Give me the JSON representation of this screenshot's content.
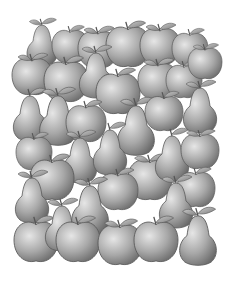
{
  "scene": {
    "description": "Grayscale illustration of densely packed apples and pears with leaves and stems",
    "background": "#ffffff",
    "palette": {
      "light": "#d9d9d9",
      "mid": "#a6a6a6",
      "dark": "#6e6e6e",
      "outline": "#5a5a5a",
      "leaf": "#9a9a9a"
    },
    "fruits": [
      {
        "type": "pear",
        "x": 42,
        "y": 45,
        "s": 0.9
      },
      {
        "type": "apple",
        "x": 70,
        "y": 45,
        "s": 0.9
      },
      {
        "type": "apple",
        "x": 98,
        "y": 48,
        "s": 1.0
      },
      {
        "type": "apple",
        "x": 128,
        "y": 45,
        "s": 1.1
      },
      {
        "type": "apple",
        "x": 160,
        "y": 45,
        "s": 1.0
      },
      {
        "type": "apple",
        "x": 190,
        "y": 48,
        "s": 0.9
      },
      {
        "type": "apple",
        "x": 32,
        "y": 75,
        "s": 1.0
      },
      {
        "type": "apple",
        "x": 66,
        "y": 80,
        "s": 1.1
      },
      {
        "type": "pear",
        "x": 96,
        "y": 75,
        "s": 1.0
      },
      {
        "type": "apple",
        "x": 118,
        "y": 92,
        "s": 1.1
      },
      {
        "type": "apple",
        "x": 158,
        "y": 80,
        "s": 1.0
      },
      {
        "type": "apple",
        "x": 184,
        "y": 80,
        "s": 0.9
      },
      {
        "type": "apple",
        "x": 205,
        "y": 62,
        "s": 0.85
      },
      {
        "type": "pear",
        "x": 30,
        "y": 118,
        "s": 1.0
      },
      {
        "type": "pear",
        "x": 58,
        "y": 120,
        "s": 1.1
      },
      {
        "type": "apple",
        "x": 86,
        "y": 122,
        "s": 1.0
      },
      {
        "type": "pear",
        "x": 136,
        "y": 130,
        "s": 1.1
      },
      {
        "type": "apple",
        "x": 164,
        "y": 112,
        "s": 0.95
      },
      {
        "type": "pear",
        "x": 200,
        "y": 110,
        "s": 1.0
      },
      {
        "type": "apple",
        "x": 34,
        "y": 152,
        "s": 0.9
      },
      {
        "type": "pear",
        "x": 80,
        "y": 160,
        "s": 1.0
      },
      {
        "type": "pear",
        "x": 110,
        "y": 152,
        "s": 1.0
      },
      {
        "type": "apple",
        "x": 150,
        "y": 178,
        "s": 1.1
      },
      {
        "type": "pear",
        "x": 172,
        "y": 158,
        "s": 1.0
      },
      {
        "type": "apple",
        "x": 200,
        "y": 150,
        "s": 0.95
      },
      {
        "type": "apple",
        "x": 52,
        "y": 178,
        "s": 1.1
      },
      {
        "type": "pear",
        "x": 32,
        "y": 200,
        "s": 1.0
      },
      {
        "type": "apple",
        "x": 118,
        "y": 190,
        "s": 1.0
      },
      {
        "type": "pear",
        "x": 90,
        "y": 210,
        "s": 1.1
      },
      {
        "type": "apple",
        "x": 196,
        "y": 188,
        "s": 0.95
      },
      {
        "type": "pear",
        "x": 176,
        "y": 205,
        "s": 1.0
      },
      {
        "type": "apple",
        "x": 36,
        "y": 240,
        "s": 1.1
      },
      {
        "type": "pear",
        "x": 62,
        "y": 228,
        "s": 1.0
      },
      {
        "type": "apple",
        "x": 78,
        "y": 240,
        "s": 1.1
      },
      {
        "type": "apple",
        "x": 120,
        "y": 243,
        "s": 1.1
      },
      {
        "type": "apple",
        "x": 156,
        "y": 240,
        "s": 1.1
      },
      {
        "type": "pear",
        "x": 198,
        "y": 240,
        "s": 1.1
      }
    ]
  }
}
